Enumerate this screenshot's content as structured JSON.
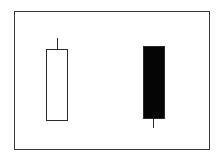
{
  "diagram": {
    "type": "candlestick-pattern",
    "frame": {
      "x": 14,
      "y": 11,
      "width": 196,
      "height": 139,
      "border_color": "#3a3a3a"
    },
    "candles": [
      {
        "name": "bullish-white-candle",
        "fill": "#ffffff",
        "stroke": "#2a2a2a",
        "body": {
          "x": 46,
          "y": 49,
          "width": 22,
          "height": 72
        },
        "upper_wick": {
          "x": 56.5,
          "y": 38,
          "height": 11
        },
        "lower_wick": null
      },
      {
        "name": "bearish-black-candle",
        "fill": "#050505",
        "stroke": "#2a2a2a",
        "body": {
          "x": 143,
          "y": 46,
          "width": 22,
          "height": 73
        },
        "upper_wick": null,
        "lower_wick": {
          "x": 152.5,
          "y": 119,
          "height": 9
        }
      }
    ]
  }
}
